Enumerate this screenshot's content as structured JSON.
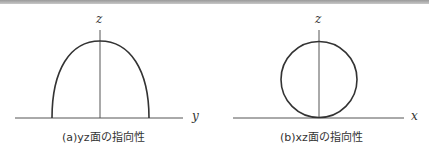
{
  "figures": [
    {
      "id": "a",
      "caption": "(a)yz面の指向性",
      "vertical_axis_label": "z",
      "horizontal_axis_label": "y",
      "shape": "semi-ellipse (hemispherical lobe)"
    },
    {
      "id": "b",
      "caption": "(b)xz面の指向性",
      "vertical_axis_label": "z",
      "horizontal_axis_label": "x",
      "shape": "circle tangent to axis"
    }
  ],
  "colors": {
    "line": "#333333",
    "axis": "#555555",
    "topbar": "#a8a8a8"
  }
}
